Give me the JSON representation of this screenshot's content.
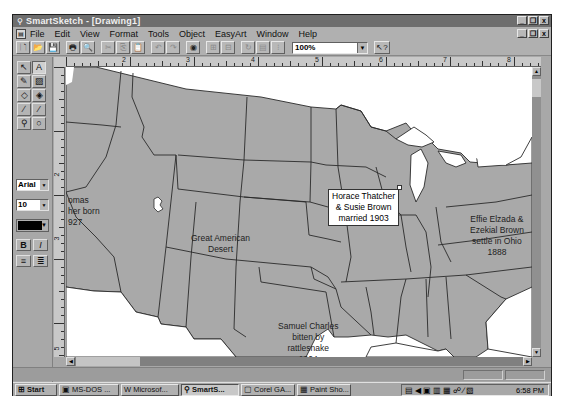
{
  "window": {
    "app_icon": "smartsketch-icon",
    "title": "SmartSketch - [Drawing1]",
    "controls": [
      "_",
      "❐",
      "x"
    ]
  },
  "menubar": {
    "items": [
      {
        "label": "File",
        "accel": "F"
      },
      {
        "label": "Edit",
        "accel": "E"
      },
      {
        "label": "View",
        "accel": "V"
      },
      {
        "label": "Format",
        "accel": "o"
      },
      {
        "label": "Tools",
        "accel": "T"
      },
      {
        "label": "Object",
        "accel": "b"
      },
      {
        "label": "EasyArt",
        "accel": "A"
      },
      {
        "label": "Window",
        "accel": "W"
      },
      {
        "label": "Help",
        "accel": "H"
      }
    ]
  },
  "toolbar": {
    "buttons": [
      {
        "name": "new",
        "glyph": "🗋"
      },
      {
        "name": "open",
        "glyph": "📂"
      },
      {
        "name": "save",
        "glyph": "💾"
      },
      {
        "name": "print",
        "glyph": "🖶"
      },
      {
        "name": "print-preview",
        "glyph": "🔍"
      },
      {
        "name": "cut",
        "glyph": "✂"
      },
      {
        "name": "copy",
        "glyph": "⎘"
      },
      {
        "name": "paste",
        "glyph": "📋"
      },
      {
        "name": "undo",
        "glyph": "↶"
      },
      {
        "name": "redo",
        "glyph": "↷"
      },
      {
        "name": "symbol-library",
        "glyph": "◉"
      },
      {
        "name": "group",
        "glyph": "⊞"
      },
      {
        "name": "ungroup",
        "glyph": "⊟"
      },
      {
        "name": "rotate",
        "glyph": "↻"
      },
      {
        "name": "align",
        "glyph": "▤"
      },
      {
        "name": "distribute",
        "glyph": "⁝"
      }
    ],
    "zoom_value": "100%",
    "help_glyph": "↖?"
  },
  "toolbox": {
    "tools": [
      {
        "name": "select",
        "glyph": "↖"
      },
      {
        "name": "text",
        "glyph": "A"
      },
      {
        "name": "pencil",
        "glyph": "✎"
      },
      {
        "name": "fill",
        "glyph": "▨"
      },
      {
        "name": "eraser",
        "glyph": "◇"
      },
      {
        "name": "paint-bucket",
        "glyph": "◈"
      },
      {
        "name": "brush",
        "glyph": "∕"
      },
      {
        "name": "eyedropper",
        "glyph": "⁄"
      },
      {
        "name": "zoom",
        "glyph": "⚲"
      },
      {
        "name": "lasso",
        "glyph": "○"
      }
    ],
    "font_name": "Arial",
    "font_size": "10",
    "text_color": "#000000",
    "bold_label": "B",
    "italic_label": "I",
    "align_left_glyph": "≡",
    "align_right_glyph": "≣"
  },
  "rulers": {
    "horizontal_numbers": [
      "2",
      "3",
      "4",
      "5",
      "6",
      "7",
      "8"
    ],
    "vertical_numbers": [
      "2",
      "3",
      "5"
    ]
  },
  "canvas": {
    "map_fill": "#a9a9a9",
    "water_fill": "#ffffff",
    "annotations": [
      {
        "id": "thomas",
        "lines": [
          "omas",
          "her born",
          "927"
        ]
      },
      {
        "id": "great-american-desert",
        "lines": [
          "Great American",
          "Desert"
        ]
      },
      {
        "id": "samuel-charles",
        "lines": [
          "Samuel Charles",
          "bitten by",
          "rattlesnake",
          "1904"
        ]
      },
      {
        "id": "effie-ezekial",
        "lines": [
          "Effie Elzada &",
          "Ezekial Brown",
          "settle in Ohio",
          "1888"
        ]
      }
    ],
    "selected_textbox": {
      "lines": [
        "Horace Thatcher",
        "& Susie Brown",
        "married 1903"
      ]
    }
  },
  "taskbar": {
    "start_label": "Start",
    "tasks": [
      {
        "label": "MS-DOS ...",
        "active": false
      },
      {
        "label": "Microsof...",
        "active": false
      },
      {
        "label": "SmartS...",
        "active": true
      },
      {
        "label": "Corel GA...",
        "active": false
      },
      {
        "label": "Paint Sho...",
        "active": false
      }
    ],
    "tray_icons": [
      "network-icon",
      "speaker-icon",
      "monitor-icon",
      "display-icon",
      "keyboard-icon",
      "modem-icon",
      "pen-icon",
      "scheduler-icon"
    ],
    "clock": "6:58 PM"
  }
}
